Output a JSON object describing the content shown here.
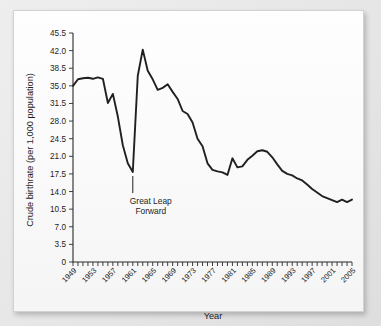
{
  "chart_data": {
    "type": "line",
    "title": "",
    "xlabel": "Year",
    "ylabel": "Crude birthrate (per 1,000 population)",
    "ylim": [
      0,
      45.5
    ],
    "xlim": [
      1949,
      2005
    ],
    "grid": false,
    "legend": null,
    "y_ticks": [
      "0",
      "3.5",
      "7.0",
      "10.5",
      "14.0",
      "17.5",
      "21.0",
      "24.5",
      "28.0",
      "31.5",
      "35.0",
      "38.5",
      "42.0",
      "45.5"
    ],
    "x_ticks_labeled": [
      "1949",
      "1953",
      "1957",
      "1961",
      "1965",
      "1969",
      "1973",
      "1977",
      "1981",
      "1985",
      "1989",
      "1993",
      "1997",
      "2001",
      "2005"
    ],
    "x_tick_every_years": 1,
    "x_label_every_years": 4,
    "series": [
      {
        "name": "Crude birthrate",
        "color": "#231f20",
        "x": [
          1949,
          1950,
          1951,
          1952,
          1953,
          1954,
          1955,
          1956,
          1957,
          1958,
          1959,
          1960,
          1961,
          1962,
          1963,
          1964,
          1965,
          1966,
          1967,
          1968,
          1969,
          1970,
          1971,
          1972,
          1973,
          1974,
          1975,
          1976,
          1977,
          1978,
          1979,
          1980,
          1981,
          1982,
          1983,
          1984,
          1985,
          1986,
          1987,
          1988,
          1989,
          1990,
          1991,
          1992,
          1993,
          1994,
          1995,
          1996,
          1997,
          1998,
          1999,
          2000,
          2001,
          2002,
          2003,
          2004,
          2005
        ],
        "values": [
          35.0,
          36.3,
          36.5,
          36.6,
          36.4,
          36.7,
          36.4,
          31.6,
          33.4,
          28.9,
          23.2,
          19.6,
          17.9,
          37.0,
          42.2,
          38.0,
          36.3,
          34.2,
          34.6,
          35.3,
          33.8,
          32.4,
          30.0,
          29.4,
          27.7,
          24.5,
          23.0,
          19.6,
          18.3,
          18.0,
          17.8,
          17.3,
          20.6,
          18.8,
          19.0,
          20.3,
          21.1,
          22.0,
          22.2,
          21.9,
          20.8,
          19.4,
          18.1,
          17.5,
          17.2,
          16.6,
          16.2,
          15.4,
          14.5,
          13.8,
          13.1,
          12.7,
          12.3,
          11.9,
          12.4,
          11.9,
          12.4
        ]
      }
    ],
    "annotations": [
      {
        "name": "great-leap-forward",
        "lines": [
          "Great Leap",
          "Forward"
        ],
        "points_to_year": 1961,
        "points_to_value": 17.9
      }
    ]
  }
}
